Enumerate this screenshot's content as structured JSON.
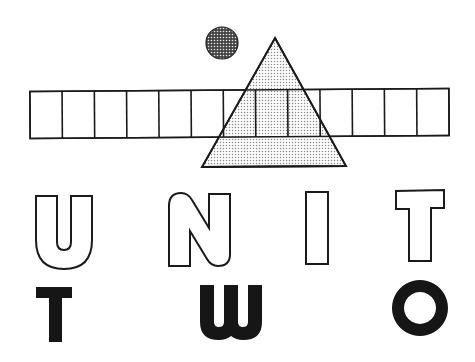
{
  "title": {
    "line1": "UNIT",
    "line2": "TWO",
    "line1_letters": [
      "U",
      "N",
      "I",
      "T"
    ],
    "line2_letters": [
      "T",
      "W",
      "O"
    ]
  },
  "illustration": {
    "description": "Stippled circle, a 13-cell horizontal strip, and a stippled triangle overlapping the strip",
    "strip_cell_count": 13,
    "shapes": [
      "circle",
      "cell-strip",
      "triangle"
    ]
  },
  "colors": {
    "background": "#ffffff",
    "ink": "#1a1a1a",
    "stipple_light": "#c8c8c8",
    "stipple_dark": "#555555"
  }
}
